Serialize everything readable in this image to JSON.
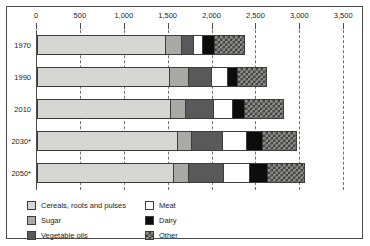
{
  "chart_data": {
    "type": "bar",
    "orientation": "horizontal",
    "stacked": true,
    "title": "",
    "subtitle": "",
    "xlabel": "",
    "ylabel": "",
    "xlim": [
      0,
      3500
    ],
    "xticks": [
      0,
      500,
      1000,
      1500,
      2000,
      2500,
      3000,
      3500
    ],
    "xtick_labels": [
      "0",
      "500",
      "1,000",
      "1,500",
      "2,000",
      "2,500",
      "3,000",
      "3,500"
    ],
    "grid": true,
    "grid_axis": "x",
    "grid_style": "dashed",
    "legend_position": "bottom-left",
    "categories": [
      "1970",
      "1990",
      "2010",
      "2030*",
      "2050*"
    ],
    "series": [
      {
        "name": "Cereals, roots and pulses",
        "color": "#d6d6d2",
        "values": [
          1460,
          1500,
          1510,
          1600,
          1555
        ]
      },
      {
        "name": "Sugar",
        "color": "#a9a9a5",
        "values": [
          185,
          215,
          175,
          155,
          160
        ]
      },
      {
        "name": "Vegetable oils",
        "color": "#595959",
        "values": [
          130,
          270,
          320,
          350,
          400
        ]
      },
      {
        "name": "Meat",
        "color": "#ffffff",
        "values": [
          110,
          180,
          215,
          280,
          300
        ]
      },
      {
        "name": "Dairy",
        "color": "#0d0d0d",
        "values": [
          135,
          110,
          140,
          175,
          205
        ]
      },
      {
        "name": "Other",
        "color": "#8e8e8a",
        "values": [
          355,
          345,
          455,
          405,
          430
        ]
      }
    ],
    "totals": [
      2375,
      2620,
      2815,
      2965,
      3050
    ]
  },
  "legend": {
    "items": [
      {
        "label": "Cereals, roots and pulses",
        "swatch": "fill-cereals"
      },
      {
        "label": "Sugar",
        "swatch": "fill-sugar"
      },
      {
        "label": "Vegetable oils",
        "swatch": "fill-veg"
      },
      {
        "label": "Meat",
        "swatch": "fill-meat"
      },
      {
        "label": "Dairy",
        "swatch": "fill-dairy"
      },
      {
        "label": "Other",
        "swatch": "fill-other"
      }
    ]
  }
}
